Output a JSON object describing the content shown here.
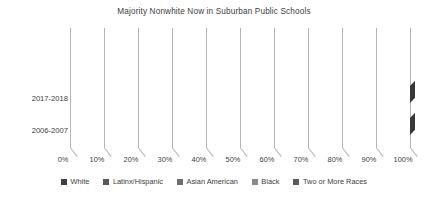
{
  "chart_data": {
    "type": "bar",
    "subtype": "stacked-horizontal-3d",
    "title": "Majority Nonwhite Now in Suburban Public Schools",
    "xlabel": "",
    "ylabel": "",
    "xlim": [
      0,
      100
    ],
    "grid": true,
    "legend_position": "bottom",
    "categories": [
      "2017-2018",
      "2006-2007"
    ],
    "xticks": [
      "0%",
      "10%",
      "20%",
      "30%",
      "40%",
      "50%",
      "60%",
      "70%",
      "80%",
      "90%",
      "100%"
    ],
    "xtick_values": [
      0,
      10,
      20,
      30,
      40,
      50,
      60,
      70,
      80,
      90,
      100
    ],
    "series": [
      {
        "name": "White",
        "color": "#3f3f3f",
        "values": [
          45,
          59
        ]
      },
      {
        "name": "Latinx/Hispanic",
        "color": "#565656",
        "values": [
          29,
          22
        ]
      },
      {
        "name": "Asian American",
        "color": "#6e6e6e",
        "values": [
          7,
          5
        ]
      },
      {
        "name": "Black",
        "color": "#8a8a8a",
        "values": [
          14,
          12
        ]
      },
      {
        "name": "Two or More Races",
        "color": "#5a5a5a",
        "values": [
          5,
          2
        ]
      }
    ],
    "bar_boundaries": {
      "2017-2018": [
        45,
        74,
        81,
        95,
        100
      ],
      "2006-2007": [
        59,
        81,
        86,
        98,
        100
      ]
    }
  },
  "legend": {
    "items": [
      {
        "label": "White",
        "swatch": "#3f3f3f"
      },
      {
        "label": "Latinx/Hispanic",
        "swatch": "#565656"
      },
      {
        "label": "Asian American",
        "swatch": "#6e6e6e"
      },
      {
        "label": "Black",
        "swatch": "#8a8a8a"
      },
      {
        "label": "Two or More Races",
        "swatch": "#5a5a5a"
      }
    ]
  },
  "style": {
    "background": "#ffffff",
    "gridline_color": "#b4b4b4",
    "text_color": "#3c3c3c"
  }
}
